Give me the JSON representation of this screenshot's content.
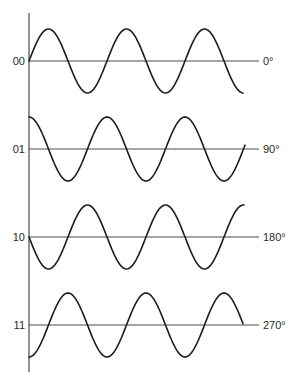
{
  "diagram": {
    "type": "phase-shift-keying-waveforms",
    "axis": {
      "x": 29,
      "y_top": 13,
      "y_bottom": 372
    },
    "wave_geometry": {
      "x_start": 29,
      "period_px": 78,
      "amplitude_px": 32,
      "baseline_end_x": 259
    },
    "rows": [
      {
        "bits": "00",
        "phase": "0°",
        "baseline_y": 61,
        "phase_deg": 0,
        "wave_end_x": 243
      },
      {
        "bits": "01",
        "phase": "90°",
        "baseline_y": 149,
        "phase_deg": 90,
        "wave_end_x": 245
      },
      {
        "bits": "10",
        "phase": "180°",
        "baseline_y": 237,
        "phase_deg": 180,
        "wave_end_x": 244
      },
      {
        "bits": "11",
        "phase": "270°",
        "baseline_y": 325,
        "phase_deg": 270,
        "wave_end_x": 243
      }
    ]
  }
}
